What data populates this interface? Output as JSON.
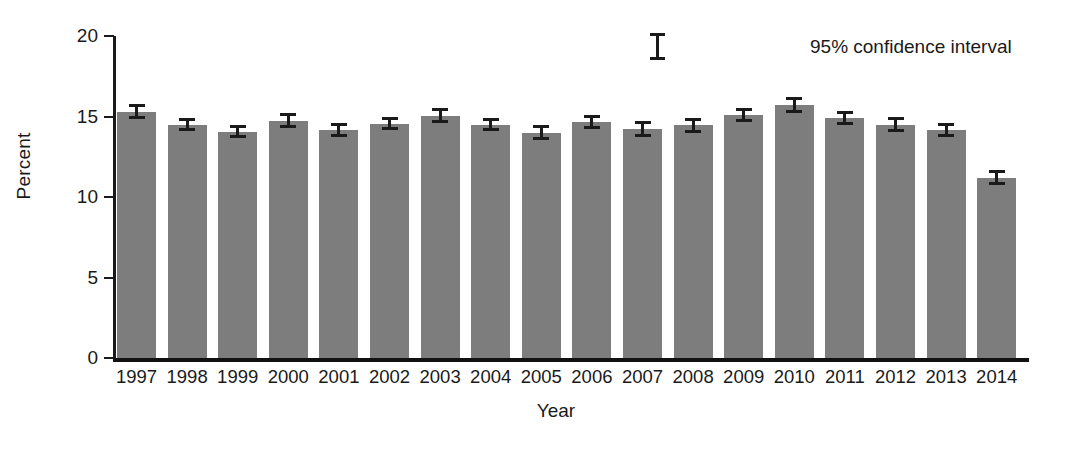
{
  "chart_data": {
    "type": "bar",
    "title": "",
    "subtitle": "",
    "xlabel": "Year",
    "ylabel": "Percent",
    "categories": [
      "1997",
      "1998",
      "1999",
      "2000",
      "2001",
      "2002",
      "2003",
      "2004",
      "2005",
      "2006",
      "2007",
      "2008",
      "2009",
      "2010",
      "2011",
      "2012",
      "2013",
      "2014"
    ],
    "values": [
      15.3,
      14.5,
      14.05,
      14.75,
      14.15,
      14.55,
      15.05,
      14.5,
      14.0,
      14.65,
      14.25,
      14.45,
      15.1,
      15.7,
      14.9,
      14.5,
      14.15,
      11.2
    ],
    "error_low": [
      14.85,
      14.1,
      13.65,
      14.3,
      13.7,
      14.15,
      14.6,
      14.1,
      13.55,
      14.2,
      13.75,
      14.0,
      14.65,
      15.2,
      14.45,
      14.05,
      13.7,
      10.75
    ],
    "error_high": [
      15.75,
      14.9,
      14.45,
      15.2,
      14.6,
      14.95,
      15.5,
      14.9,
      14.45,
      15.1,
      14.75,
      14.9,
      15.55,
      16.2,
      15.35,
      14.95,
      14.6,
      11.65
    ],
    "error_type": "95% confidence interval",
    "ylim": [
      0,
      20
    ],
    "yticks": [
      0,
      5,
      10,
      15,
      20
    ],
    "ytick_labels": [
      "0",
      "5",
      "10",
      "15",
      "20"
    ],
    "grid": false,
    "legend_position": "top-right",
    "legend": [
      {
        "label": "95% confidence interval",
        "symbol": "error-bar"
      }
    ],
    "colors": {
      "bar_fill": "#7d7d7d",
      "axis": "#1a1a1a",
      "error_bar": "#1a1a1a",
      "background": "#ffffff"
    }
  },
  "axes": {
    "y_title": "Percent",
    "x_title": "Year"
  },
  "legend": {
    "confidence_label": "95% confidence interval"
  }
}
